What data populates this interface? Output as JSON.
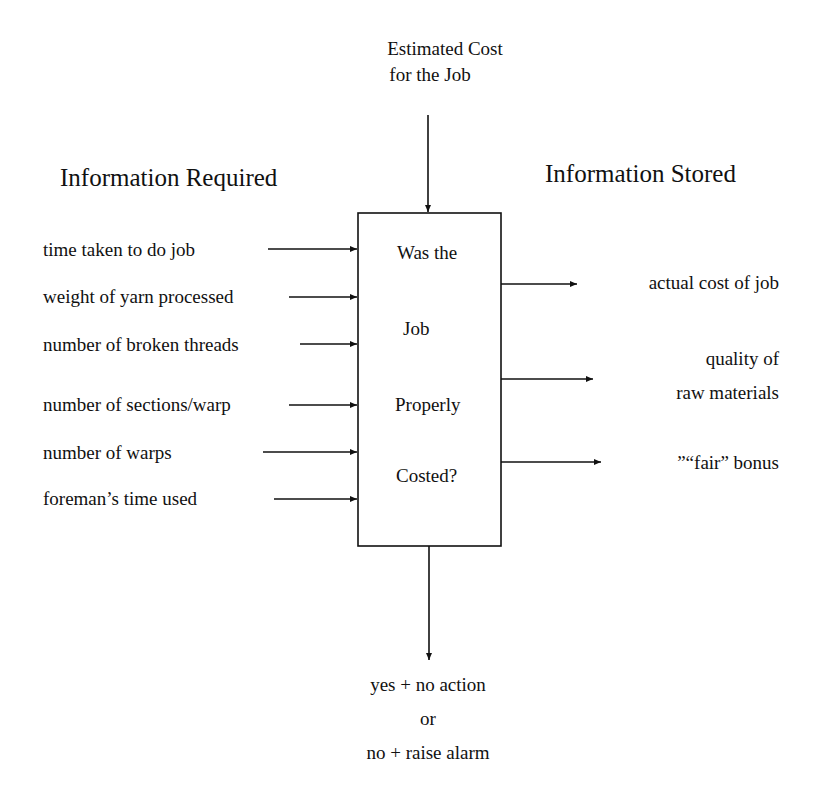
{
  "top_input": {
    "line1": "Estimated Cost",
    "line2": "for the Job"
  },
  "left_heading": "Information Required",
  "right_heading": "Information Stored",
  "inputs": [
    "time taken to do job",
    "weight of yarn processed",
    "number of broken threads",
    "number of sections/warp",
    "number of warps",
    "foreman’s time used"
  ],
  "process": [
    "Was the",
    "Job",
    "Properly",
    "Costed?"
  ],
  "outputs": [
    {
      "line1": "actual cost of job"
    },
    {
      "line1": "quality of",
      "line2": "raw materials"
    },
    {
      "line1": "”“fair” bonus"
    }
  ],
  "bottom_output": {
    "line1": "yes + no action",
    "line2": "or",
    "line3": "no + raise alarm"
  }
}
